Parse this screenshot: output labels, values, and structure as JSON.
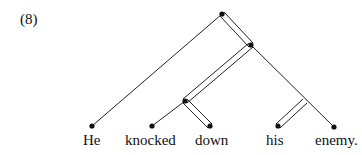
{
  "example_number": "(8)",
  "words": [
    {
      "text": "He",
      "x": 92
    },
    {
      "text": "knocked",
      "x": 152
    },
    {
      "text": "down",
      "x": 210
    },
    {
      "text": "his",
      "x": 278
    },
    {
      "text": "enemy.",
      "x": 337
    }
  ],
  "tree": {
    "type": "dependency tree with double-line head branches",
    "nodes": {
      "root": [
        222,
        14
      ],
      "vp": [
        251,
        45
      ],
      "verb_particle": [
        185,
        101
      ],
      "np": [
        305,
        101
      ],
      "He": [
        92,
        126
      ],
      "knocked": [
        152,
        126
      ],
      "down": [
        210,
        126
      ],
      "his": [
        278,
        126
      ],
      "enemy": [
        334,
        127
      ]
    },
    "edges": [
      {
        "from": "root",
        "to": "He",
        "style": "single"
      },
      {
        "from": "root",
        "to": "vp",
        "style": "double"
      },
      {
        "from": "vp",
        "to": "verb_particle",
        "style": "double"
      },
      {
        "from": "vp",
        "to": "enemy",
        "style": "single"
      },
      {
        "from": "verb_particle",
        "to": "knocked",
        "style": "single"
      },
      {
        "from": "verb_particle",
        "to": "down",
        "style": "double"
      },
      {
        "from": "np",
        "to": "his",
        "style": "double"
      }
    ]
  }
}
